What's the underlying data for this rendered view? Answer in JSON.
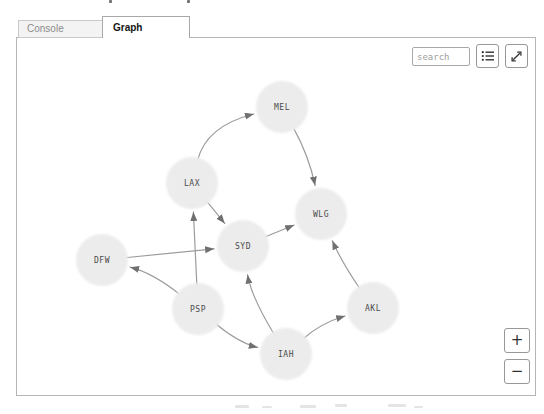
{
  "tabs": [
    {
      "label": "Console",
      "active": false
    },
    {
      "label": "Graph",
      "active": true
    }
  ],
  "toolbar": {
    "search_placeholder": "search",
    "list_button_icon": "list-icon",
    "expand_button_icon": "expand-icon"
  },
  "zoom_controls": {
    "zoom_in_label": "+",
    "zoom_out_label": "−"
  },
  "chart_data": {
    "type": "graph",
    "directed": true,
    "node_radius": 26,
    "node_fill": "#ececec",
    "edge_color": "#9c9c9c",
    "arrow_color": "#707070",
    "label_color": "#4a4a4a",
    "nodes": [
      {
        "id": "MEL",
        "label": "MEL",
        "x": 265,
        "y": 69
      },
      {
        "id": "LAX",
        "label": "LAX",
        "x": 175,
        "y": 145
      },
      {
        "id": "WLG",
        "label": "WLG",
        "x": 304,
        "y": 176
      },
      {
        "id": "SYD",
        "label": "SYD",
        "x": 226,
        "y": 208
      },
      {
        "id": "DFW",
        "label": "DFW",
        "x": 85,
        "y": 222
      },
      {
        "id": "PSP",
        "label": "PSP",
        "x": 181,
        "y": 271
      },
      {
        "id": "AKL",
        "label": "AKL",
        "x": 356,
        "y": 270
      },
      {
        "id": "IAH",
        "label": "IAH",
        "x": 269,
        "y": 316
      }
    ],
    "edges": [
      {
        "from": "LAX",
        "to": "MEL",
        "control": [
          189,
          88
        ]
      },
      {
        "from": "MEL",
        "to": "WLG",
        "control": [
          292,
          118
        ]
      },
      {
        "from": "LAX",
        "to": "SYD"
      },
      {
        "from": "SYD",
        "to": "WLG"
      },
      {
        "from": "DFW",
        "to": "SYD"
      },
      {
        "from": "PSP",
        "to": "DFW",
        "control": [
          136,
          235
        ]
      },
      {
        "from": "PSP",
        "to": "LAX"
      },
      {
        "from": "PSP",
        "to": "IAH",
        "control": [
          222,
          305
        ]
      },
      {
        "from": "IAH",
        "to": "SYD",
        "control": [
          234,
          258
        ]
      },
      {
        "from": "IAH",
        "to": "AKL",
        "control": [
          304,
          285
        ]
      },
      {
        "from": "AKL",
        "to": "WLG",
        "control": [
          324,
          223
        ]
      }
    ]
  }
}
